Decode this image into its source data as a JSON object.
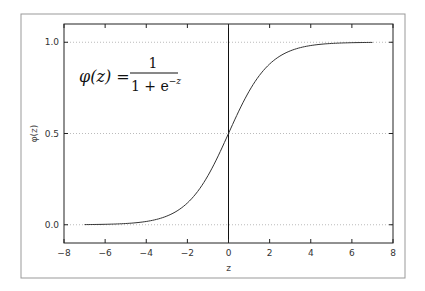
{
  "chart_data": {
    "type": "line",
    "title": "",
    "xlabel": "z",
    "ylabel": "φ(z)",
    "xlim": [
      -8,
      8
    ],
    "ylim": [
      -0.1,
      1.1
    ],
    "xticks": [
      -8,
      -6,
      -4,
      -2,
      0,
      2,
      4,
      6,
      8
    ],
    "xtick_labels": [
      "−8",
      "−6",
      "−4",
      "−2",
      "0",
      "2",
      "4",
      "6",
      "8"
    ],
    "yticks": [
      0.0,
      0.5,
      1.0
    ],
    "ytick_labels": [
      "0.0",
      "0.5",
      "1.0"
    ],
    "grid": "horizontal-dotted",
    "vline": 0.0,
    "series": [
      {
        "name": "sigmoid",
        "function": "1/(1+exp(-z))",
        "x_range": [
          -7,
          7
        ],
        "step": 0.1,
        "color": "#333333"
      }
    ],
    "annotation": {
      "lhs": "φ(z) =",
      "numerator": "1",
      "denominator_base": "1 + e",
      "denominator_exp": "−z"
    }
  }
}
